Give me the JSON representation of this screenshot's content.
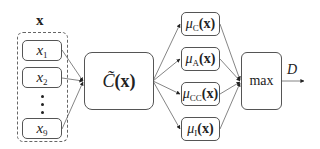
{
  "input_group": {
    "title": "x",
    "items": [
      {
        "var": "x",
        "sub": "1"
      },
      {
        "var": "x",
        "sub": "2"
      },
      {
        "var": "x",
        "sub": "9"
      }
    ],
    "ellipsis_dots": 3
  },
  "classifier": {
    "label": "C̃",
    "arg": "(x)"
  },
  "memberships": [
    {
      "mu": "μ",
      "sub": "C",
      "arg": "(x)"
    },
    {
      "mu": "μ",
      "sub": "A",
      "arg": "(x)"
    },
    {
      "mu": "μ",
      "sub": "CC",
      "arg": "(x)"
    },
    {
      "mu": "μ",
      "sub": "I",
      "arg": "(x)"
    }
  ],
  "aggregator": {
    "label": "max"
  },
  "output": {
    "label": "D"
  }
}
